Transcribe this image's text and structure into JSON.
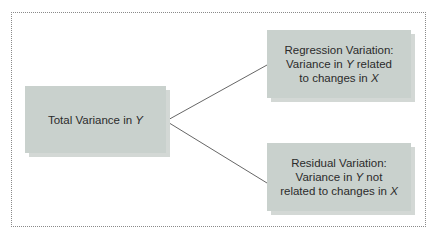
{
  "diagram": {
    "root": {
      "label_prefix": "Total Variance in ",
      "label_var": "Y"
    },
    "children": [
      {
        "title": "Regression Variation:",
        "line2_prefix": "Variance in ",
        "line2_var": "Y",
        "line2_suffix": " related",
        "line3_prefix": "to changes in ",
        "line3_var": "X"
      },
      {
        "title": "Residual Variation:",
        "line2_prefix": "Variance in ",
        "line2_var": "Y",
        "line2_suffix": " not",
        "line3_prefix": "related to changes in ",
        "line3_var": "X"
      }
    ],
    "colors": {
      "box_fill": "#c9d1cd",
      "box_shadow": "#d3d8d5",
      "connector": "#555555",
      "frame": "#8a8a8a"
    }
  }
}
